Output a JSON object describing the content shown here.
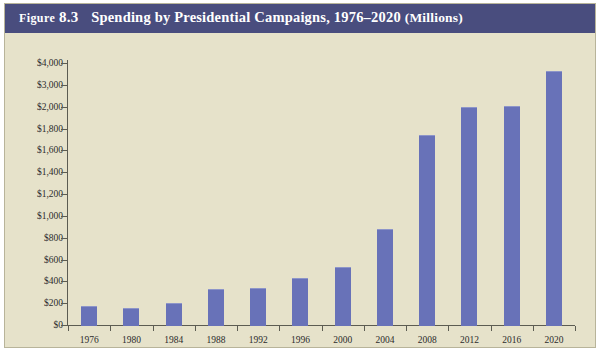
{
  "figure": {
    "label_prefix": "Figure",
    "number": "8.3",
    "title_main": "Spending by Presidential Campaigns, 1976–2020",
    "title_units": "(Millions)",
    "banner_color": "#494d7e",
    "background_color": "#e6e2ca",
    "bar_color": "#6872b8"
  },
  "chart_data": {
    "type": "bar",
    "title": "Spending by Presidential Campaigns, 1976–2020 (Millions)",
    "xlabel": "",
    "ylabel": "",
    "categories": [
      "1976",
      "1980",
      "1984",
      "1988",
      "1992",
      "1996",
      "2000",
      "2004",
      "2008",
      "2012",
      "2016",
      "2020"
    ],
    "values": [
      170,
      160,
      200,
      330,
      340,
      430,
      530,
      880,
      1740,
      2000,
      2050,
      3650
    ],
    "value_labels": [
      "$170",
      "$160",
      "$200",
      "$330",
      "$340",
      "$430",
      "$530",
      "$880",
      "$1,740",
      "$2,000",
      "$2,050",
      "$3,650"
    ],
    "ytick_labels": [
      "$4,000",
      "$3,000",
      "$2,000",
      "$1,800",
      "$1,600",
      "$1,400",
      "$1,200",
      "$1,000",
      "$800",
      "$600",
      "$400",
      "$200",
      "$0"
    ],
    "ytick_values": [
      4000,
      3000,
      2000,
      1800,
      1600,
      1400,
      1200,
      1000,
      800,
      600,
      400,
      200,
      0
    ],
    "axis_note": "broken axis: evenly spaced ticks, $200 increments to $2,000 then $1,000 increments",
    "ylim": [
      0,
      4000
    ],
    "grid": false,
    "legend": "none"
  }
}
